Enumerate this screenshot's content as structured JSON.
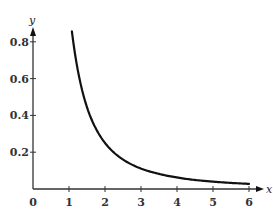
{
  "chart_data": {
    "type": "line",
    "title": "",
    "xlabel": "x",
    "ylabel": "y",
    "xlim": [
      0,
      6
    ],
    "ylim": [
      0,
      0.8
    ],
    "grid": false,
    "legend": null,
    "x_ticks": [
      {
        "value": 0,
        "label": "0"
      },
      {
        "value": 1,
        "label": "1"
      },
      {
        "value": 2,
        "label": "2"
      },
      {
        "value": 3,
        "label": "3"
      },
      {
        "value": 4,
        "label": "4"
      },
      {
        "value": 5,
        "label": "5"
      },
      {
        "value": 6,
        "label": "6"
      }
    ],
    "y_ticks": [
      {
        "value": 0.2,
        "label": "0.2"
      },
      {
        "value": 0.4,
        "label": "0.4"
      },
      {
        "value": 0.6,
        "label": "0.6"
      },
      {
        "value": 0.8,
        "label": "0.8"
      }
    ],
    "series": [
      {
        "name": "y = 1/x^2",
        "x": [
          1.08,
          1.25,
          1.5,
          1.75,
          2,
          2.5,
          3,
          3.5,
          4,
          4.5,
          5,
          5.5,
          6
        ],
        "values": [
          0.857,
          0.64,
          0.444,
          0.327,
          0.25,
          0.16,
          0.111,
          0.082,
          0.0625,
          0.049,
          0.04,
          0.033,
          0.028
        ]
      }
    ],
    "colors": {
      "curve": "#111111",
      "axis": "#333333"
    }
  }
}
